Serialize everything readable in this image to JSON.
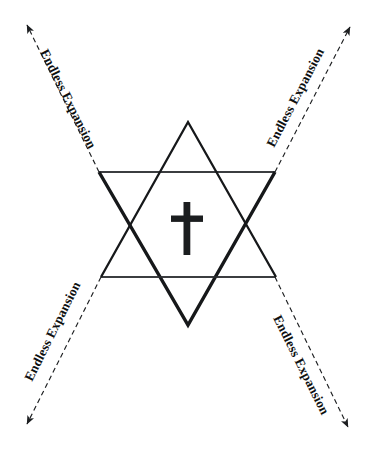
{
  "figure": {
    "background_color": "#ffffff",
    "ink_color": "#16181a"
  },
  "center_symbol": {
    "name": "latin-cross",
    "label": "Latin cross"
  },
  "star": {
    "name": "hexagram",
    "label": "Six-pointed star",
    "upward_triangle_label": "Upward triangle",
    "downward_triangle_label": "Downward triangle"
  },
  "axes": [
    {
      "id": "top-left",
      "label": "Endless Expansion",
      "direction": "upper-left",
      "rotation": -47
    },
    {
      "id": "top-right",
      "label": "Endless Expansion",
      "direction": "upper-right",
      "rotation": 47
    },
    {
      "id": "bottom-left",
      "label": "Endless Expansion",
      "direction": "lower-left",
      "rotation": 47
    },
    {
      "id": "bottom-right",
      "label": "Endless Expansion",
      "direction": "lower-right",
      "rotation": -47
    }
  ]
}
